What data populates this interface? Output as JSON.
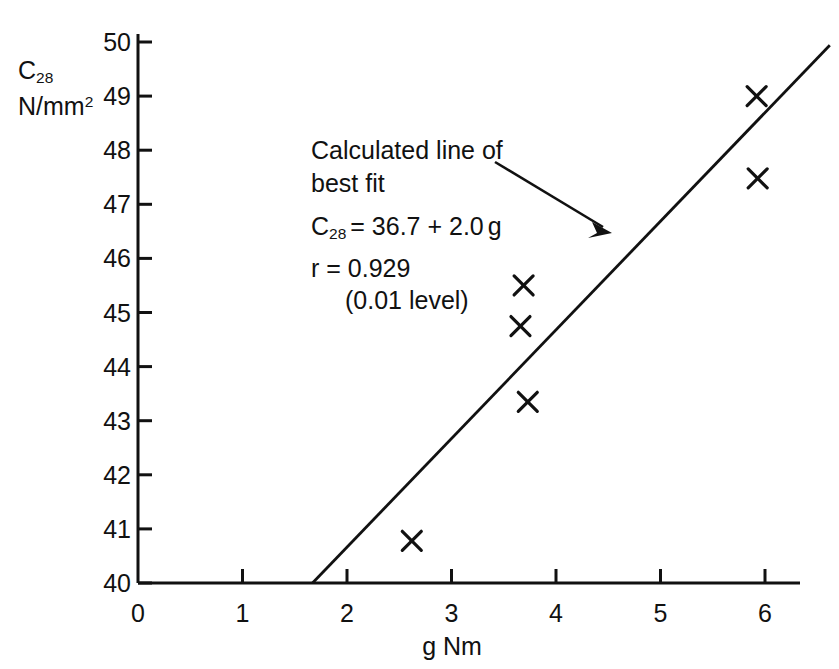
{
  "chart_data": {
    "type": "scatter",
    "title": "",
    "xlabel": "g Nm",
    "ylabel": "C28 N/mm2",
    "ylabel_lines": [
      "C28",
      "N/mm2"
    ],
    "xlim": [
      0,
      6
    ],
    "ylim": [
      40,
      50
    ],
    "xticks": [
      "0",
      "1",
      "2",
      "3",
      "4",
      "5",
      "6"
    ],
    "xtick_values": [
      0,
      1,
      2,
      3,
      4,
      5,
      6
    ],
    "yticks": [
      "40",
      "41",
      "42",
      "43",
      "44",
      "45",
      "46",
      "47",
      "48",
      "49",
      "50"
    ],
    "ytick_values": [
      40,
      41,
      42,
      43,
      44,
      45,
      46,
      47,
      48,
      49,
      50
    ],
    "grid": false,
    "legend_position": "none",
    "marker": "x",
    "points": [
      {
        "x": 2.62,
        "y": 40.78
      },
      {
        "x": 3.66,
        "y": 44.75
      },
      {
        "x": 3.69,
        "y": 45.5
      },
      {
        "x": 3.73,
        "y": 43.35
      },
      {
        "x": 5.92,
        "y": 49.0
      },
      {
        "x": 5.93,
        "y": 47.48
      }
    ],
    "series": [
      {
        "name": "measurements",
        "x": [
          2.62,
          3.66,
          3.69,
          3.73,
          5.92,
          5.93
        ],
        "values": [
          40.78,
          44.75,
          45.5,
          43.35,
          49.0,
          47.48
        ]
      }
    ],
    "fit_line": {
      "label": "Calculated line of best fit",
      "equation": "C28 = 36.7 + 2.0 g",
      "intercept": 36.7,
      "slope": 2.0,
      "correlation": 0.929,
      "significance_level": "0.01 level",
      "x_start": 1.67,
      "x_end": 6.62,
      "y_start": 40.0,
      "y_end": 49.94
    }
  },
  "annotation": {
    "line1": "Calculated line of",
    "line2": "best fit",
    "equation_prefix": "C",
    "equation_sub": "28",
    "equation_rest": "= 36.7 + 2.0",
    "equation_var": "g",
    "r_text": "r = 0.929",
    "level_text": "(0.01 level)"
  },
  "axis_titles": {
    "y_symbol": "C",
    "y_symbol_sub": "28",
    "y_units_base": "N/mm",
    "y_units_sup": "2",
    "x_title": "g Nm"
  },
  "colors": {
    "ink": "#111111",
    "background": "#ffffff"
  }
}
